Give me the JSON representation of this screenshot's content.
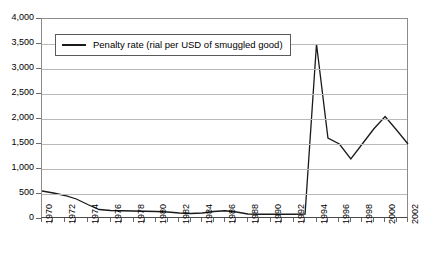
{
  "chart_data": {
    "type": "line",
    "title": "",
    "xlabel": "",
    "ylabel": "",
    "ylim": [
      0,
      4000
    ],
    "xlim": [
      1970,
      2002
    ],
    "grid": true,
    "legend_position": "top-left",
    "ytick_labels": [
      "4,000",
      "3,500",
      "3,000",
      "2,500",
      "2,000",
      "1,500",
      "1,000",
      "500",
      "0"
    ],
    "ytick_values": [
      4000,
      3500,
      3000,
      2500,
      2000,
      1500,
      1000,
      500,
      0
    ],
    "xtick_labels": [
      "1970",
      "1972",
      "1974",
      "1976",
      "1978",
      "1980",
      "1982",
      "1984",
      "1986",
      "1988",
      "1990",
      "1992",
      "1994",
      "1996",
      "1998",
      "2000",
      "2002"
    ],
    "xtick_values": [
      1970,
      1972,
      1974,
      1976,
      1978,
      1980,
      1982,
      1984,
      1986,
      1988,
      1990,
      1992,
      1994,
      1996,
      1998,
      2000,
      2002
    ],
    "series": [
      {
        "name": "Penalty rate (rial per USD of smuggled good)",
        "color": "#1a1a1a",
        "x": [
          1970,
          1971,
          1972,
          1973,
          1974,
          1975,
          1976,
          1977,
          1978,
          1979,
          1980,
          1981,
          1982,
          1983,
          1984,
          1985,
          1986,
          1987,
          1988,
          1989,
          1990,
          1991,
          1992,
          1993,
          1994,
          1995,
          1996,
          1997,
          1998,
          1999,
          2000,
          2001,
          2002
        ],
        "values": [
          560,
          520,
          470,
          400,
          290,
          190,
          170,
          165,
          160,
          155,
          150,
          140,
          120,
          110,
          120,
          150,
          165,
          140,
          100,
          95,
          95,
          95,
          95,
          100,
          3500,
          1620,
          1500,
          1200,
          1500,
          1800,
          2050,
          1780,
          1500
        ]
      }
    ]
  },
  "legend": {
    "entry_label": "Penalty rate (rial per USD of smuggled good)"
  },
  "colors": {
    "line": "#1a1a1a",
    "grid": "#b9b9b9",
    "axis": "#6a6a6a",
    "text": "#000000",
    "background": "#ffffff"
  }
}
